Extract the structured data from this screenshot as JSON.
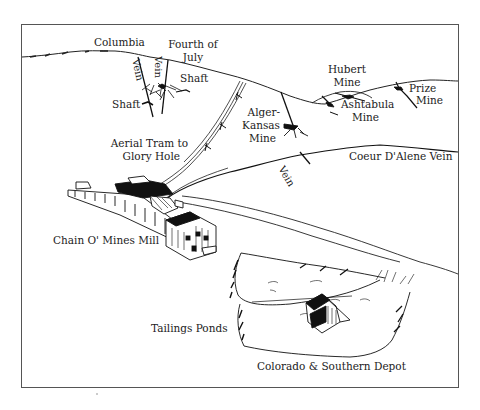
{
  "map": {
    "title": "Chain O' Mines area illustration",
    "labels": {
      "columbia": "Columbia",
      "fourth_of_july_1": "Fourth of",
      "fourth_of_july_2": "July",
      "shaft_right": "Shaft",
      "shaft_left": "Shaft",
      "vein_1": "Vein",
      "vein_2": "Vein",
      "vein_3": "Vein",
      "hubert_1": "Hubert",
      "hubert_2": "Mine",
      "ashtabula_1": "Ashtabula",
      "ashtabula_2": "Mine",
      "prize_1": "Prize",
      "prize_2": "Mine",
      "alger_1": "Alger-",
      "alger_2": "Kansas",
      "alger_3": "Mine",
      "aerial_tram_1": "Aerial Tram to",
      "aerial_tram_2": "Glory Hole",
      "coeur_dalene": "Coeur D'Alene Vein",
      "mill": "Chain O' Mines Mill",
      "tailings": "Tailings Ponds",
      "depot": "Colorado & Southern Depot"
    },
    "colors": {
      "ink": "#1a1a1a",
      "paper": "#ffffff",
      "frame": "#444444"
    }
  }
}
